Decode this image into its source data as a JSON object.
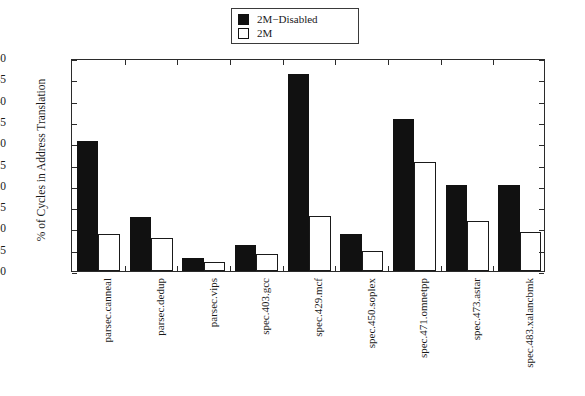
{
  "chart_data": {
    "type": "bar",
    "title": "",
    "xlabel": "",
    "ylabel": "% of Cycles in Address Translation",
    "ylim": [
      0.0,
      0.5
    ],
    "ytick_labels": [
      "0.50",
      "0.45",
      "0.40",
      "0.35",
      "0.30",
      "0.25",
      "0.20",
      "0.15",
      "0.10",
      "0.05",
      "0.00"
    ],
    "ytick_values": [
      0.5,
      0.45,
      0.4,
      0.35,
      0.3,
      0.25,
      0.2,
      0.15,
      0.1,
      0.05,
      0.0
    ],
    "grid": false,
    "legend_position": "top-center",
    "categories": [
      "parsec.canneal",
      "parsec.dedup",
      "parsec.vips",
      "spec.403.gcc",
      "spec.429.mcf",
      "spec.450.soplex",
      "spec.471.omnetpp",
      "spec.473.astar",
      "spec.483.xalancbmk"
    ],
    "series": [
      {
        "name": "2M−Disabled",
        "color": "#111111",
        "fill": "solid",
        "values": [
          0.305,
          0.126,
          0.03,
          0.061,
          0.463,
          0.087,
          0.357,
          0.203,
          0.202
        ]
      },
      {
        "name": "2M",
        "color": "#ffffff",
        "fill": "hollow",
        "values": [
          0.087,
          0.077,
          0.021,
          0.04,
          0.128,
          0.047,
          0.257,
          0.117,
          0.092
        ]
      }
    ]
  },
  "legend": {
    "entries": [
      {
        "label": "2M−Disabled",
        "swatch": "filled"
      },
      {
        "label": "2M",
        "swatch": "hollow"
      }
    ]
  }
}
